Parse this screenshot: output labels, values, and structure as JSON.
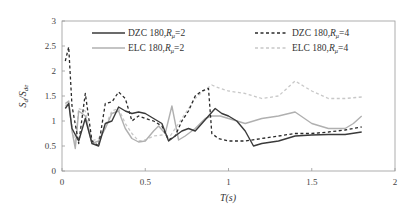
{
  "chart_data": {
    "type": "line",
    "title": "",
    "xlabel": "T(s)",
    "ylabel": "Sd/Sde",
    "xlim": [
      0,
      2
    ],
    "ylim": [
      0,
      3
    ],
    "xticks": [
      "0",
      "0.5",
      "1",
      "1.5",
      "2"
    ],
    "yticks": [
      "0",
      "0.5",
      "1",
      "1.5",
      "2",
      "2.5",
      "3"
    ],
    "grid": false,
    "legend_position": "top, inside, 2 columns",
    "series": [
      {
        "name": "DZC 180,Rμ=2",
        "style": "solid",
        "color": "#3a3a3a",
        "x": [
          0.02,
          0.04,
          0.06,
          0.1,
          0.14,
          0.18,
          0.22,
          0.26,
          0.3,
          0.34,
          0.38,
          0.42,
          0.46,
          0.5,
          0.55,
          0.6,
          0.64,
          0.68,
          0.72,
          0.76,
          0.8,
          0.84,
          0.88,
          0.92,
          0.96,
          1.0,
          1.05,
          1.1,
          1.15,
          1.2,
          1.3,
          1.4,
          1.5,
          1.6,
          1.7,
          1.8
        ],
        "y": [
          1.25,
          1.35,
          0.85,
          0.6,
          1.05,
          0.55,
          0.5,
          0.95,
          1.0,
          1.28,
          1.2,
          1.15,
          1.18,
          1.15,
          1.05,
          0.95,
          0.6,
          0.7,
          0.8,
          0.85,
          0.8,
          0.95,
          1.1,
          1.25,
          1.15,
          1.1,
          1.0,
          0.8,
          0.5,
          0.55,
          0.6,
          0.7,
          0.72,
          0.73,
          0.73,
          0.78
        ]
      },
      {
        "name": "DZC 180,Rμ=4",
        "style": "dashed",
        "color": "#2a2a2a",
        "x": [
          0.02,
          0.04,
          0.06,
          0.1,
          0.14,
          0.18,
          0.22,
          0.26,
          0.3,
          0.34,
          0.38,
          0.42,
          0.46,
          0.5,
          0.55,
          0.6,
          0.64,
          0.68,
          0.72,
          0.76,
          0.8,
          0.84,
          0.88,
          0.9,
          0.94,
          1.0,
          1.05,
          1.1,
          1.2,
          1.3,
          1.4,
          1.5,
          1.6,
          1.7,
          1.8
        ],
        "y": [
          2.2,
          2.48,
          1.3,
          0.55,
          1.55,
          0.6,
          0.5,
          1.35,
          1.38,
          1.58,
          1.45,
          1.0,
          1.1,
          1.05,
          1.0,
          0.9,
          0.62,
          0.7,
          1.0,
          1.2,
          1.5,
          1.6,
          1.65,
          0.75,
          0.65,
          0.6,
          0.6,
          0.6,
          0.65,
          0.7,
          0.75,
          0.75,
          0.78,
          0.82,
          0.88
        ]
      },
      {
        "name": "ELC 180,Rμ=2",
        "style": "solid",
        "color": "#b0b0b0",
        "x": [
          0.02,
          0.04,
          0.06,
          0.08,
          0.1,
          0.14,
          0.18,
          0.22,
          0.26,
          0.3,
          0.34,
          0.38,
          0.42,
          0.46,
          0.5,
          0.55,
          0.58,
          0.62,
          0.66,
          0.7,
          0.74,
          0.8,
          0.86,
          0.9,
          0.95,
          1.0,
          1.1,
          1.2,
          1.3,
          1.4,
          1.5,
          1.6,
          1.7,
          1.75,
          1.8
        ],
        "y": [
          1.35,
          1.4,
          0.8,
          0.45,
          1.2,
          1.1,
          0.55,
          0.6,
          0.85,
          1.15,
          1.2,
          0.85,
          0.65,
          0.58,
          0.6,
          0.8,
          0.9,
          0.75,
          1.3,
          0.62,
          0.7,
          0.85,
          1.05,
          1.1,
          1.1,
          1.05,
          0.95,
          1.05,
          1.1,
          1.18,
          0.95,
          0.85,
          0.85,
          0.95,
          1.1
        ]
      },
      {
        "name": "ELC 180,Rμ=4",
        "style": "dashed",
        "color": "#c8c8c8",
        "x": [
          0.02,
          0.04,
          0.06,
          0.08,
          0.1,
          0.14,
          0.18,
          0.22,
          0.26,
          0.3,
          0.34,
          0.38,
          0.42,
          0.46,
          0.5,
          0.55,
          0.6,
          0.65,
          0.7,
          0.75,
          0.8,
          0.85,
          0.9,
          0.95,
          1.0,
          1.1,
          1.2,
          1.3,
          1.35,
          1.4,
          1.45,
          1.5,
          1.6,
          1.7,
          1.8
        ],
        "y": [
          1.3,
          1.38,
          0.9,
          0.55,
          1.25,
          1.2,
          0.6,
          0.65,
          0.9,
          1.2,
          1.25,
          0.95,
          0.75,
          0.6,
          0.62,
          0.7,
          0.72,
          0.7,
          0.95,
          1.2,
          1.45,
          1.6,
          1.72,
          1.65,
          1.6,
          1.55,
          1.45,
          1.5,
          1.65,
          1.8,
          1.7,
          1.6,
          1.45,
          1.45,
          1.48
        ]
      }
    ]
  },
  "axes": {
    "xlabel": "T(s)",
    "ylabel_main": "S",
    "ylabel_sub1": "d",
    "ylabel_sep": "/S",
    "ylabel_sub2": "de",
    "xticks": [
      "0",
      "0.5",
      "1",
      "1.5",
      "2"
    ],
    "yticks": [
      "0",
      "0.5",
      "1",
      "1.5",
      "2",
      "2.5",
      "3"
    ]
  },
  "legend": {
    "items": [
      {
        "prefix": "DZC 180,",
        "r": "R",
        "sub": "μ",
        "suffix": "=2"
      },
      {
        "prefix": "DZC 180,",
        "r": "R",
        "sub": "μ",
        "suffix": "=4"
      },
      {
        "prefix": "ELC 180,",
        "r": "R",
        "sub": "μ",
        "suffix": "=2"
      },
      {
        "prefix": "ELC 180,",
        "r": "R",
        "sub": "μ",
        "suffix": "=4"
      }
    ]
  }
}
